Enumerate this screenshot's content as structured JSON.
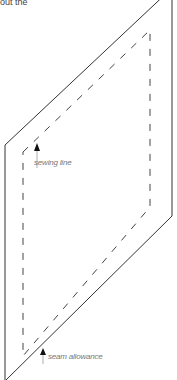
{
  "intro_text_fragment": "out the",
  "labels": {
    "sewing_line": "sewing line",
    "seam_allowance": "seam allowance"
  },
  "colors": {
    "outline": "#333333",
    "dashed": "#444444",
    "arrow": "#111111",
    "label": "#777777"
  },
  "shapes": {
    "outer_parallelogram": [
      [
        5,
        145
      ],
      [
        172,
        -10
      ],
      [
        172,
        216
      ],
      [
        5,
        380
      ]
    ],
    "inner_dashed_parallelogram": [
      [
        23,
        152
      ],
      [
        150,
        30
      ],
      [
        150,
        207
      ],
      [
        23,
        356
      ]
    ]
  }
}
